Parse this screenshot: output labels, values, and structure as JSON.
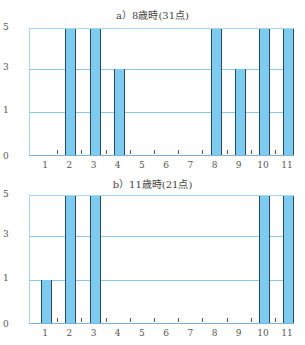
{
  "chart_data": [
    {
      "type": "bar",
      "title": "a）8歳時(31点)",
      "categories": [
        "1",
        "2",
        "3",
        "4",
        "5",
        "6",
        "7",
        "8",
        "9",
        "10",
        "11"
      ],
      "values": [
        0,
        5,
        5,
        3,
        0,
        0,
        0,
        5,
        3,
        5,
        5
      ],
      "yticks": [
        "0",
        "1",
        "3",
        "5"
      ],
      "ylim": [
        0,
        5
      ],
      "xlabel": "",
      "ylabel": "",
      "grid": true,
      "bar_color": "#7ecbf0"
    },
    {
      "type": "bar",
      "title": "b）11歳時(21点)",
      "categories": [
        "1",
        "2",
        "3",
        "4",
        "5",
        "6",
        "7",
        "8",
        "9",
        "10",
        "11"
      ],
      "values": [
        1,
        5,
        5,
        0,
        0,
        0,
        0,
        0,
        0,
        5,
        5
      ],
      "yticks": [
        "0",
        "1",
        "3",
        "5"
      ],
      "ylim": [
        0,
        5
      ],
      "xlabel": "",
      "ylabel": "",
      "grid": true,
      "bar_color": "#7ecbf0"
    }
  ]
}
